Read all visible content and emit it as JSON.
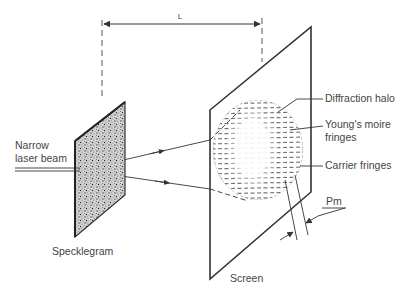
{
  "labels": {
    "distance": "L",
    "beam_line1": "Narrow",
    "beam_line2": "laser beam",
    "specklegram": "Specklegram",
    "screen": "Screen",
    "halo": "Diffraction halo",
    "youngs_line1": "Young's moire",
    "youngs_line2": "fringes",
    "carrier": "Carrier fringes",
    "pitch": "Pm"
  },
  "colors": {
    "ink": "#333333",
    "text": "#444444",
    "speckle_fill": "#bdbdbd"
  }
}
